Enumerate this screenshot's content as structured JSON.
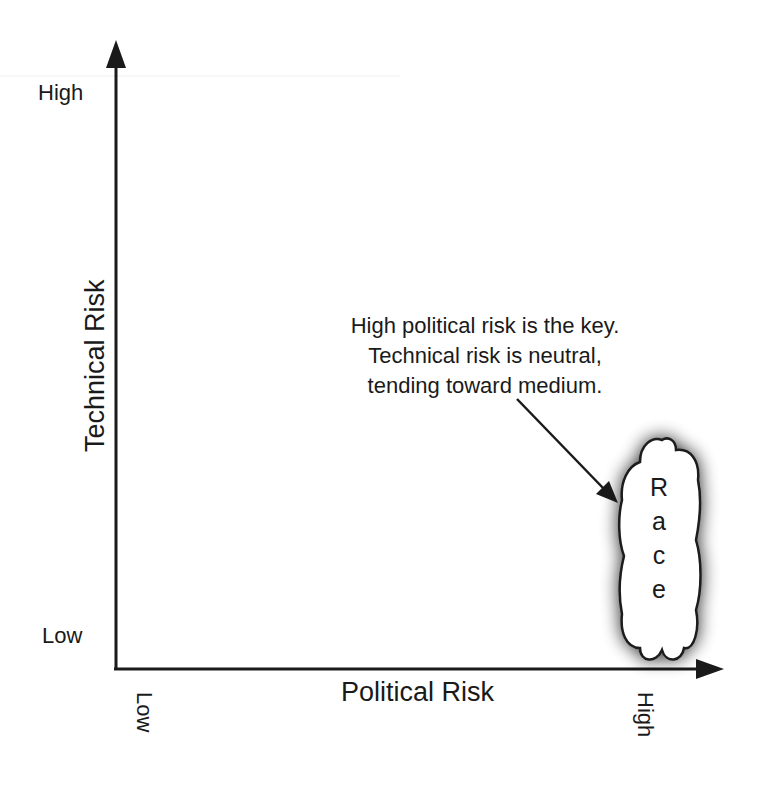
{
  "diagram": {
    "type": "risk-quadrant",
    "y_axis": {
      "title": "Technical Risk",
      "high_label": "High",
      "low_label": "Low"
    },
    "x_axis": {
      "title": "Political Risk",
      "low_label": "Low",
      "high_label": "High"
    },
    "annotation": {
      "lines": [
        "High political risk is the key.",
        "Technical risk is neutral,",
        "tending toward medium."
      ]
    },
    "cloud": {
      "label": "Race",
      "letters": [
        "R",
        "a",
        "c",
        "e"
      ],
      "position": "high political risk, low-to-medium technical risk"
    },
    "colors": {
      "ink": "#1a1a1a",
      "background": "#ffffff",
      "shadow": "#555555"
    }
  }
}
